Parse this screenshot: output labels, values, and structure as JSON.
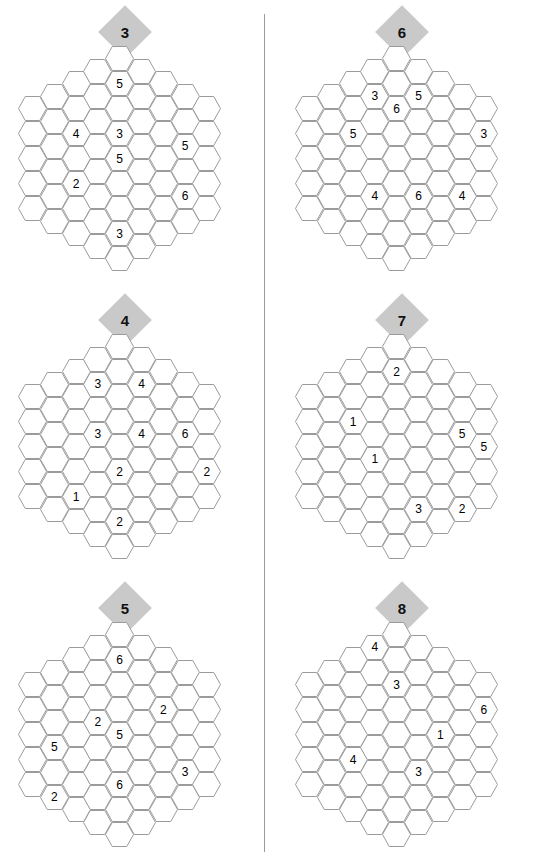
{
  "page": {
    "layout": "two-column-six-puzzles",
    "grid_shape": "hexagon-of-hexagons",
    "columns_sizes": [
      5,
      6,
      7,
      8,
      9,
      8,
      7,
      6,
      5
    ],
    "total_cells": 61,
    "colors": {
      "badge_fill": "#c9c9c9",
      "hex_stroke": "#9b9b9b",
      "divider": "#9a9a9a",
      "text": "#000000",
      "background": "#ffffff"
    }
  },
  "puzzles": [
    {
      "id": "puzzle-3",
      "badge": "3",
      "position": {
        "left": 0,
        "top": 0
      },
      "clues": [
        {
          "col": 4,
          "row": 1,
          "value": "5"
        },
        {
          "col": 2,
          "row": 2,
          "value": "4"
        },
        {
          "col": 4,
          "row": 3,
          "value": "3"
        },
        {
          "col": 7,
          "row": 2,
          "value": "5"
        },
        {
          "col": 4,
          "row": 4,
          "value": "5"
        },
        {
          "col": 2,
          "row": 4,
          "value": "2"
        },
        {
          "col": 7,
          "row": 4,
          "value": "6"
        },
        {
          "col": 4,
          "row": 7,
          "value": "3"
        }
      ]
    },
    {
      "id": "puzzle-6",
      "badge": "6",
      "position": {
        "left": 277,
        "top": 0
      },
      "clues": [
        {
          "col": 3,
          "row": 1,
          "value": "3"
        },
        {
          "col": 5,
          "row": 1,
          "value": "5"
        },
        {
          "col": 2,
          "row": 2,
          "value": "5"
        },
        {
          "col": 8,
          "row": 1,
          "value": "3"
        },
        {
          "col": 4,
          "row": 2,
          "value": "6"
        },
        {
          "col": 7,
          "row": 4,
          "value": "4"
        },
        {
          "col": 3,
          "row": 5,
          "value": "4"
        },
        {
          "col": 5,
          "row": 5,
          "value": "6"
        }
      ]
    },
    {
      "id": "puzzle-4",
      "badge": "4",
      "position": {
        "left": 0,
        "top": 288
      },
      "clues": [
        {
          "col": 5,
          "row": 1,
          "value": "4"
        },
        {
          "col": 3,
          "row": 1,
          "value": "3"
        },
        {
          "col": 7,
          "row": 2,
          "value": "6"
        },
        {
          "col": 3,
          "row": 3,
          "value": "3"
        },
        {
          "col": 5,
          "row": 3,
          "value": "4"
        },
        {
          "col": 4,
          "row": 5,
          "value": "2"
        },
        {
          "col": 8,
          "row": 3,
          "value": "2"
        },
        {
          "col": 2,
          "row": 5,
          "value": "1"
        },
        {
          "col": 4,
          "row": 7,
          "value": "2"
        }
      ]
    },
    {
      "id": "puzzle-7",
      "badge": "7",
      "position": {
        "left": 277,
        "top": 288
      },
      "clues": [
        {
          "col": 4,
          "row": 1,
          "value": "2"
        },
        {
          "col": 7,
          "row": 2,
          "value": "5"
        },
        {
          "col": 2,
          "row": 2,
          "value": "1"
        },
        {
          "col": 8,
          "row": 2,
          "value": "5"
        },
        {
          "col": 3,
          "row": 4,
          "value": "1"
        },
        {
          "col": 7,
          "row": 5,
          "value": "2"
        },
        {
          "col": 5,
          "row": 6,
          "value": "3"
        }
      ]
    },
    {
      "id": "puzzle-5",
      "badge": "5",
      "position": {
        "left": 0,
        "top": 576
      },
      "clues": [
        {
          "col": 4,
          "row": 1,
          "value": "6"
        },
        {
          "col": 6,
          "row": 2,
          "value": "2"
        },
        {
          "col": 3,
          "row": 3,
          "value": "2"
        },
        {
          "col": 1,
          "row": 3,
          "value": "5"
        },
        {
          "col": 4,
          "row": 4,
          "value": "5"
        },
        {
          "col": 7,
          "row": 4,
          "value": "3"
        },
        {
          "col": 1,
          "row": 5,
          "value": "2"
        },
        {
          "col": 4,
          "row": 6,
          "value": "6"
        }
      ]
    },
    {
      "id": "puzzle-8",
      "badge": "8",
      "position": {
        "left": 277,
        "top": 576
      },
      "clues": [
        {
          "col": 3,
          "row": 0,
          "value": "4"
        },
        {
          "col": 4,
          "row": 2,
          "value": "3"
        },
        {
          "col": 8,
          "row": 1,
          "value": "6"
        },
        {
          "col": 2,
          "row": 4,
          "value": "4"
        },
        {
          "col": 6,
          "row": 3,
          "value": "1"
        },
        {
          "col": 5,
          "row": 5,
          "value": "3"
        }
      ]
    }
  ]
}
